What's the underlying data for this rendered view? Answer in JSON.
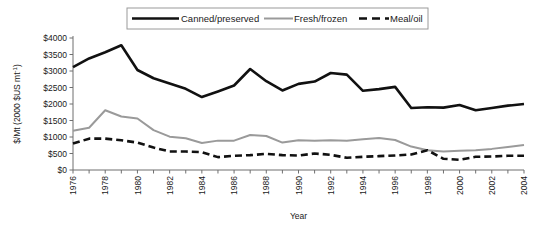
{
  "chart_data": {
    "type": "line",
    "title": "",
    "xlabel": "Year",
    "ylabel": "$/Mt (2000 $US mt⁻¹)",
    "xlim": [
      1976,
      2004
    ],
    "ylim": [
      0,
      4000
    ],
    "ytick_step": 500,
    "ytick_labels": [
      "$4000",
      "$3500",
      "$3000",
      "$2500",
      "$2000",
      "$1500",
      "$1000",
      "$500",
      "$0"
    ],
    "ytick_values": [
      4000,
      3500,
      3000,
      2500,
      2000,
      1500,
      1000,
      500,
      0
    ],
    "xtick_labels": [
      "1976",
      "1978",
      "1980",
      "1982",
      "1984",
      "1986",
      "1988",
      "1990",
      "1992",
      "1994",
      "1996",
      "1998",
      "2000",
      "2002",
      "2004"
    ],
    "xtick_values": [
      1976,
      1978,
      1980,
      1982,
      1984,
      1986,
      1988,
      1990,
      1992,
      1994,
      1996,
      1998,
      2000,
      2002,
      2004
    ],
    "x": [
      1976,
      1977,
      1978,
      1979,
      1980,
      1981,
      1982,
      1983,
      1984,
      1985,
      1986,
      1987,
      1988,
      1989,
      1990,
      1991,
      1992,
      1993,
      1994,
      1995,
      1996,
      1997,
      1998,
      1999,
      2000,
      2001,
      2002,
      2003,
      2004
    ],
    "grid": false,
    "legend_position": "top",
    "series": [
      {
        "name": "Canned/preserved",
        "style": "solid",
        "color": "#111111",
        "width": 2.6,
        "values": [
          3120,
          3380,
          3570,
          3780,
          3030,
          2780,
          2620,
          2460,
          2210,
          2380,
          2560,
          3060,
          2690,
          2410,
          2610,
          2680,
          2940,
          2890,
          2400,
          2450,
          2520,
          1880,
          1900,
          1890,
          1970,
          1810,
          1880,
          1950,
          2000
        ]
      },
      {
        "name": "Fresh/frozen",
        "style": "solid",
        "color": "#9a9a9a",
        "width": 2.0,
        "values": [
          1190,
          1280,
          1810,
          1620,
          1560,
          1210,
          1010,
          960,
          820,
          890,
          890,
          1060,
          1030,
          830,
          900,
          890,
          900,
          890,
          930,
          970,
          910,
          710,
          600,
          560,
          580,
          600,
          640,
          700,
          760
        ]
      },
      {
        "name": "Meal/oil",
        "style": "dashed",
        "color": "#111111",
        "width": 2.6,
        "values": [
          800,
          950,
          950,
          900,
          830,
          680,
          560,
          560,
          540,
          390,
          430,
          450,
          490,
          450,
          440,
          500,
          460,
          370,
          400,
          420,
          440,
          470,
          600,
          340,
          310,
          400,
          410,
          430,
          430
        ]
      }
    ]
  },
  "legend": {
    "items": [
      {
        "label": "Canned/preserved"
      },
      {
        "label": "Fresh/frozen"
      },
      {
        "label": "Meal/oil"
      }
    ]
  }
}
